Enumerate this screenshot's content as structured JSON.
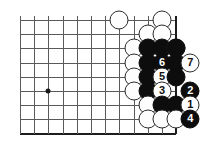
{
  "diagram": {
    "type": "go-board-diagram",
    "board": {
      "columns": 12,
      "rows": 9,
      "cell_size": 14.2,
      "origin_x": 20,
      "origin_y": 20,
      "right_edge_column": 11,
      "bottom_edge_row": 8,
      "line_color": "#5a5a5a",
      "edge_color": "#1d1d1d",
      "background_color": "#ffffff"
    },
    "star_points": [
      {
        "col": 2,
        "row": 5
      }
    ],
    "stones": [
      {
        "col": 7,
        "row": 0,
        "color": "white",
        "label": ""
      },
      {
        "col": 10,
        "row": 0,
        "color": "white",
        "label": ""
      },
      {
        "col": 9,
        "row": 1,
        "color": "white",
        "label": ""
      },
      {
        "col": 10,
        "row": 1,
        "color": "white",
        "label": ""
      },
      {
        "col": 8,
        "row": 2,
        "color": "white",
        "label": ""
      },
      {
        "col": 9,
        "row": 2,
        "color": "black",
        "label": ""
      },
      {
        "col": 10,
        "row": 2,
        "color": "black",
        "label": ""
      },
      {
        "col": 11,
        "row": 2,
        "color": "white",
        "label": ""
      },
      {
        "col": 8,
        "row": 3,
        "color": "white",
        "label": ""
      },
      {
        "col": 9,
        "row": 3,
        "color": "black",
        "label": ""
      },
      {
        "col": 10,
        "row": 3,
        "color": "black",
        "label": "6"
      },
      {
        "col": 11,
        "row": 3,
        "color": "black",
        "label": ""
      },
      {
        "col": 8,
        "row": 4,
        "color": "white",
        "label": ""
      },
      {
        "col": 9,
        "row": 4,
        "color": "black",
        "label": ""
      },
      {
        "col": 10,
        "row": 4,
        "color": "white",
        "label": "5"
      },
      {
        "col": 11,
        "row": 4,
        "color": "black",
        "label": ""
      },
      {
        "col": 8,
        "row": 5,
        "color": "white",
        "label": ""
      },
      {
        "col": 9,
        "row": 5,
        "color": "black",
        "label": ""
      },
      {
        "col": 10,
        "row": 5,
        "color": "white",
        "label": "3"
      },
      {
        "col": 9,
        "row": 6,
        "color": "white",
        "label": ""
      },
      {
        "col": 10,
        "row": 6,
        "color": "black",
        "label": ""
      },
      {
        "col": 11,
        "row": 6,
        "color": "black",
        "label": ""
      },
      {
        "col": 9,
        "row": 7,
        "color": "white",
        "label": ""
      },
      {
        "col": 10,
        "row": 7,
        "color": "white",
        "label": ""
      },
      {
        "col": 11,
        "row": 7,
        "color": "white",
        "label": ""
      }
    ],
    "extra_stones": [
      {
        "col": 11,
        "row": 2,
        "color": "black",
        "label": "",
        "name": "corner-black-stone"
      },
      {
        "col": 12,
        "row": 3,
        "color": "white",
        "label": "7",
        "name": "move-7-white-stone"
      },
      {
        "col": 12,
        "row": 5,
        "color": "black",
        "label": "2",
        "name": "move-2-black-stone"
      },
      {
        "col": 12,
        "row": 6,
        "color": "white",
        "label": "1",
        "name": "move-1-white-stone"
      },
      {
        "col": 12,
        "row": 7,
        "color": "black",
        "label": "4",
        "name": "move-4-black-stone"
      }
    ],
    "move_sequence": [
      {
        "number": "1",
        "color": "white"
      },
      {
        "number": "2",
        "color": "black"
      },
      {
        "number": "3",
        "color": "white"
      },
      {
        "number": "4",
        "color": "black"
      },
      {
        "number": "5",
        "color": "white"
      },
      {
        "number": "6",
        "color": "black"
      },
      {
        "number": "7",
        "color": "white"
      }
    ]
  }
}
